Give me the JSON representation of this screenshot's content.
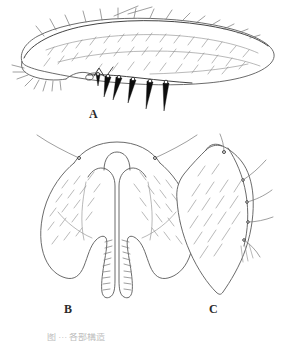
{
  "plate": {
    "width": 295,
    "height": 341,
    "background_color": "#ffffff",
    "ink_color": "#5a5a5a",
    "dark_ink_color": "#111111",
    "label_color": "#2b2b2b",
    "medium_ink_color": "#6e6e6e"
  },
  "panels": [
    {
      "id": "a",
      "label": "A",
      "subject": "elongate-oval structure in lateral view with dorsal setae and dark ventral spines"
    },
    {
      "id": "b",
      "label": "B",
      "subject": "bilobed symmetric structure with median U-shaped notch and serrate inner margins"
    },
    {
      "id": "c",
      "label": "C",
      "subject": "shield-shaped plate tapering to a pointed apex with marginal setae"
    }
  ],
  "caption": {
    "text": "图 ··· 各部構造",
    "state": "clipped-at-page-edge"
  }
}
